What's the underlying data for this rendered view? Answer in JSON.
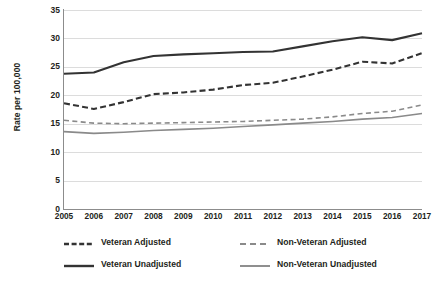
{
  "chart_data": {
    "type": "line",
    "title": "",
    "xlabel": "",
    "ylabel": "Rate per 100,000",
    "x": [
      2005,
      2006,
      2007,
      2008,
      2009,
      2010,
      2011,
      2012,
      2013,
      2014,
      2015,
      2016,
      2017
    ],
    "xtick_labels": [
      "2005",
      "2006",
      "2007",
      "2008",
      "2009",
      "2010",
      "2011",
      "2012",
      "2013",
      "2014",
      "2015",
      "2016",
      "2017"
    ],
    "ytick_labels": [
      "0",
      "5",
      "10",
      "15",
      "20",
      "25",
      "30",
      "35"
    ],
    "yticks": [
      0,
      5,
      10,
      15,
      20,
      25,
      30,
      35
    ],
    "ylim": [
      0,
      35
    ],
    "grid": true,
    "legend_position": "bottom",
    "series": [
      {
        "name": "Veteran Adjusted",
        "style": "dashed",
        "color": "#333333",
        "values": [
          18.6,
          17.6,
          18.8,
          20.2,
          20.5,
          21.0,
          21.8,
          22.2,
          23.3,
          24.5,
          25.9,
          25.6,
          27.4
        ]
      },
      {
        "name": "Veteran Unadjusted",
        "style": "solid",
        "color": "#333333",
        "values": [
          23.8,
          24.0,
          25.8,
          26.9,
          27.2,
          27.4,
          27.6,
          27.7,
          28.6,
          29.5,
          30.2,
          29.7,
          30.9
        ]
      },
      {
        "name": "Non-Veteran Adjusted",
        "style": "dashed",
        "color": "#8a8a8a",
        "values": [
          15.6,
          15.1,
          15.0,
          15.1,
          15.2,
          15.3,
          15.4,
          15.6,
          15.8,
          16.2,
          16.8,
          17.2,
          18.3
        ]
      },
      {
        "name": "Non-Veteran Unadjusted",
        "style": "solid",
        "color": "#8a8a8a",
        "values": [
          13.6,
          13.3,
          13.5,
          13.8,
          14.0,
          14.2,
          14.5,
          14.8,
          15.1,
          15.4,
          15.8,
          16.1,
          16.8
        ]
      }
    ]
  },
  "legend": {
    "items": [
      {
        "label": "Veteran Adjusted"
      },
      {
        "label": "Non-Veteran Adjusted"
      },
      {
        "label": "Veteran Unadjusted"
      },
      {
        "label": "Non-Veteran Unadjusted"
      }
    ]
  },
  "colors": {
    "veteran": "#333333",
    "non_veteran": "#8a8a8a",
    "grid": "#dcdcdc",
    "axis": "#8c8c8c",
    "text": "#231f20",
    "background": "#ffffff"
  }
}
